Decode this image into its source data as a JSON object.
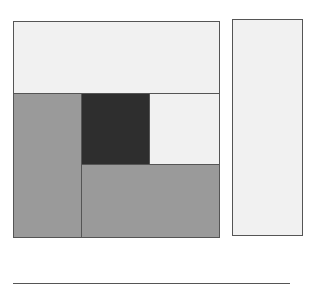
{
  "diagram": {
    "colors": {
      "light": "#f1f1f1",
      "medium": "#9a9a9a",
      "dark": "#2e2e2e",
      "border": "#555555",
      "background": "#ffffff"
    },
    "blocks": [
      {
        "name": "top-panel",
        "x": 13,
        "y": 21,
        "w": 207,
        "h": 73,
        "shade": "light"
      },
      {
        "name": "left-column",
        "x": 13,
        "y": 93,
        "w": 69,
        "h": 145,
        "shade": "medium"
      },
      {
        "name": "center-dark-square",
        "x": 81,
        "y": 93,
        "w": 69,
        "h": 72,
        "shade": "dark"
      },
      {
        "name": "right-light-square",
        "x": 149,
        "y": 93,
        "w": 71,
        "h": 72,
        "shade": "light"
      },
      {
        "name": "bottom-panel",
        "x": 81,
        "y": 164,
        "w": 139,
        "h": 74,
        "shade": "medium"
      },
      {
        "name": "side-panel",
        "x": 232,
        "y": 19,
        "w": 71,
        "h": 217,
        "shade": "light"
      }
    ],
    "baseline": {
      "x": 13,
      "y": 283,
      "w": 277
    }
  }
}
